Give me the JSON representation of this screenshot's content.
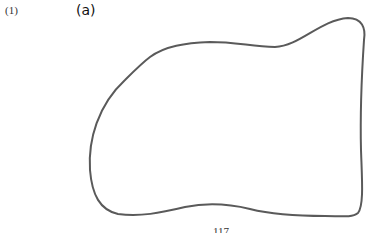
{
  "figure": {
    "problem_number": "(1)",
    "part_label": "(a)",
    "page_number": "117",
    "outline_color": "#5a5a5a",
    "shape_description": "closed freehand irregular blob outline"
  }
}
